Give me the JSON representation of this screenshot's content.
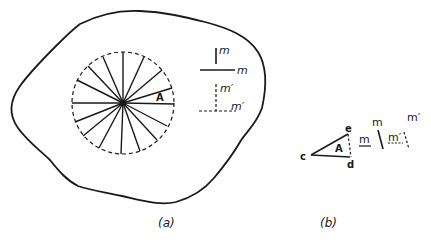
{
  "figure": {
    "panel_a": {
      "caption": "(a)",
      "sector_label": "A",
      "spoke_count": 18,
      "legend": {
        "solid_vertical_label": "m",
        "solid_horizontal_label": "m",
        "dashed_vertical_label": "m′",
        "dashed_horizontal_label": "m′"
      }
    },
    "panel_b": {
      "caption": "(b)",
      "triangle_label": "A",
      "vertex_c": "c",
      "vertex_d": "d",
      "vertex_e": "e",
      "solid_left_label": "m",
      "solid_top_label": "m",
      "dashed_left_label": "m′",
      "dashed_top_label": "m′"
    },
    "colors": {
      "ink": "#1a1a1a",
      "background": "#ffffff"
    }
  }
}
